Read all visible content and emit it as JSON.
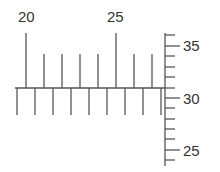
{
  "colors": {
    "line": "#555555",
    "text": "#333333",
    "background": "#ffffff"
  },
  "horizontal_ruler": {
    "y": 88,
    "x_start": 15,
    "x_end": 165,
    "upper_ticks": [
      {
        "x": 26,
        "y_top": 33,
        "major": true,
        "label": "20"
      },
      {
        "x": 44,
        "y_top": 54,
        "major": false,
        "label": ""
      },
      {
        "x": 62,
        "y_top": 54,
        "major": false,
        "label": ""
      },
      {
        "x": 80,
        "y_top": 54,
        "major": false,
        "label": ""
      },
      {
        "x": 98,
        "y_top": 54,
        "major": false,
        "label": ""
      },
      {
        "x": 116,
        "y_top": 33,
        "major": true,
        "label": "25"
      },
      {
        "x": 134,
        "y_top": 54,
        "major": false,
        "label": ""
      },
      {
        "x": 152,
        "y_top": 54,
        "major": false,
        "label": ""
      }
    ],
    "lower_ticks": [
      17,
      35,
      53,
      71,
      89,
      107,
      125,
      143,
      161
    ],
    "lower_tick_bottom": 115
  },
  "vertical_ruler": {
    "x": 165,
    "y_start": 33,
    "y_end": 166,
    "ticks": [
      {
        "y": 35,
        "major": false,
        "label": ""
      },
      {
        "y": 46,
        "major": true,
        "label": "35"
      },
      {
        "y": 56,
        "major": false,
        "label": ""
      },
      {
        "y": 67,
        "major": false,
        "label": ""
      },
      {
        "y": 77,
        "major": false,
        "label": ""
      },
      {
        "y": 88,
        "major": false,
        "label": ""
      },
      {
        "y": 98,
        "major": true,
        "label": "30"
      },
      {
        "y": 108,
        "major": false,
        "label": ""
      },
      {
        "y": 119,
        "major": false,
        "label": ""
      },
      {
        "y": 129,
        "major": false,
        "label": ""
      },
      {
        "y": 139,
        "major": false,
        "label": ""
      },
      {
        "y": 150,
        "major": true,
        "label": "25"
      },
      {
        "y": 160,
        "major": false,
        "label": ""
      }
    ]
  },
  "labels": {
    "h_20": "20",
    "h_25": "25",
    "v_35": "35",
    "v_30": "30",
    "v_25": "25"
  }
}
